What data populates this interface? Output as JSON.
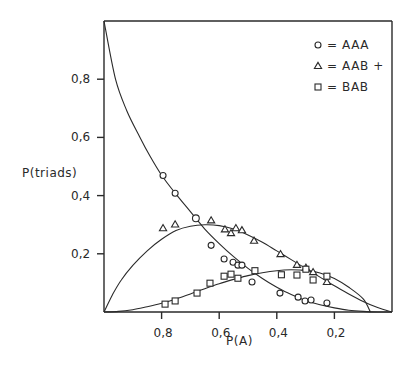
{
  "chart_data": {
    "type": "scatter",
    "title": "",
    "xlabel": "P(A)",
    "ylabel": "P(triads)",
    "xlim": [
      1.0,
      0.0
    ],
    "ylim": [
      0.0,
      1.0
    ],
    "x_reversed": true,
    "grid": false,
    "legend_position": "top-right",
    "x_ticks": [
      {
        "value": 0.8,
        "label": "0,8"
      },
      {
        "value": 0.6,
        "label": "0,6"
      },
      {
        "value": 0.4,
        "label": "0,4"
      },
      {
        "value": 0.2,
        "label": "0,2"
      }
    ],
    "y_ticks": [
      {
        "value": 0.8,
        "label": "0,8"
      },
      {
        "value": 0.6,
        "label": "0,6"
      },
      {
        "value": 0.4,
        "label": "0,4"
      },
      {
        "value": 0.2,
        "label": "0,2"
      }
    ],
    "series": [
      {
        "name": "AAA",
        "legend_label": "= AAA",
        "marker": "circle",
        "points": [
          [
            0.795,
            0.469
          ],
          [
            0.753,
            0.408
          ],
          [
            0.681,
            0.322
          ],
          [
            0.628,
            0.229
          ],
          [
            0.583,
            0.182
          ],
          [
            0.552,
            0.171
          ],
          [
            0.535,
            0.161
          ],
          [
            0.521,
            0.161
          ],
          [
            0.486,
            0.103
          ],
          [
            0.389,
            0.065
          ],
          [
            0.326,
            0.051
          ],
          [
            0.302,
            0.038
          ],
          [
            0.281,
            0.041
          ],
          [
            0.226,
            0.031
          ]
        ],
        "highlighted_point": [
          0.681,
          0.322
        ],
        "curve": [
          [
            1.0,
            1.0
          ],
          [
            0.96,
            0.8
          ],
          [
            0.92,
            0.69
          ],
          [
            0.875,
            0.6
          ],
          [
            0.84,
            0.535
          ],
          [
            0.8,
            0.47
          ],
          [
            0.75,
            0.405
          ],
          [
            0.7,
            0.345
          ],
          [
            0.65,
            0.285
          ],
          [
            0.6,
            0.235
          ],
          [
            0.55,
            0.19
          ],
          [
            0.5,
            0.15
          ],
          [
            0.45,
            0.115
          ],
          [
            0.4,
            0.085
          ],
          [
            0.35,
            0.06
          ],
          [
            0.3,
            0.04
          ],
          [
            0.25,
            0.025
          ],
          [
            0.2,
            0.014
          ],
          [
            0.15,
            0.006
          ],
          [
            0.1,
            0.002
          ],
          [
            0.05,
            0.0
          ],
          [
            0.0,
            0.0
          ]
        ]
      },
      {
        "name": "AAB",
        "legend_label": "= AAB +",
        "marker": "triangle",
        "points": [
          [
            0.795,
            0.288
          ],
          [
            0.753,
            0.301
          ],
          [
            0.628,
            0.315
          ],
          [
            0.58,
            0.284
          ],
          [
            0.559,
            0.271
          ],
          [
            0.542,
            0.288
          ],
          [
            0.521,
            0.281
          ],
          [
            0.479,
            0.245
          ],
          [
            0.387,
            0.199
          ],
          [
            0.33,
            0.162
          ],
          [
            0.299,
            0.152
          ],
          [
            0.274,
            0.137
          ],
          [
            0.226,
            0.103
          ]
        ],
        "curve": [
          [
            1.0,
            0.0
          ],
          [
            0.97,
            0.06
          ],
          [
            0.94,
            0.11
          ],
          [
            0.9,
            0.16
          ],
          [
            0.85,
            0.21
          ],
          [
            0.8,
            0.25
          ],
          [
            0.75,
            0.28
          ],
          [
            0.7,
            0.295
          ],
          [
            0.65,
            0.3
          ],
          [
            0.6,
            0.297
          ],
          [
            0.55,
            0.285
          ],
          [
            0.5,
            0.265
          ],
          [
            0.45,
            0.24
          ],
          [
            0.4,
            0.21
          ],
          [
            0.35,
            0.18
          ],
          [
            0.3,
            0.15
          ],
          [
            0.25,
            0.12
          ],
          [
            0.2,
            0.09
          ],
          [
            0.15,
            0.062
          ],
          [
            0.1,
            0.036
          ],
          [
            0.05,
            0.015
          ],
          [
            0.0,
            0.0
          ]
        ]
      },
      {
        "name": "BAB",
        "legend_label": "= BAB",
        "marker": "square",
        "points": [
          [
            0.788,
            0.027
          ],
          [
            0.753,
            0.038
          ],
          [
            0.677,
            0.065
          ],
          [
            0.632,
            0.099
          ],
          [
            0.583,
            0.123
          ],
          [
            0.559,
            0.13
          ],
          [
            0.535,
            0.116
          ],
          [
            0.476,
            0.142
          ],
          [
            0.384,
            0.128
          ],
          [
            0.33,
            0.127
          ],
          [
            0.299,
            0.147
          ],
          [
            0.274,
            0.11
          ],
          [
            0.226,
            0.123
          ]
        ],
        "curve": [
          [
            1.0,
            0.0
          ],
          [
            0.95,
            0.002
          ],
          [
            0.9,
            0.008
          ],
          [
            0.85,
            0.018
          ],
          [
            0.8,
            0.03
          ],
          [
            0.75,
            0.045
          ],
          [
            0.7,
            0.062
          ],
          [
            0.65,
            0.08
          ],
          [
            0.6,
            0.097
          ],
          [
            0.55,
            0.112
          ],
          [
            0.5,
            0.125
          ],
          [
            0.45,
            0.135
          ],
          [
            0.4,
            0.142
          ],
          [
            0.35,
            0.145
          ],
          [
            0.3,
            0.143
          ],
          [
            0.25,
            0.134
          ],
          [
            0.2,
            0.115
          ],
          [
            0.15,
            0.085
          ],
          [
            0.1,
            0.045
          ],
          [
            0.075,
            0.0
          ]
        ]
      }
    ]
  }
}
